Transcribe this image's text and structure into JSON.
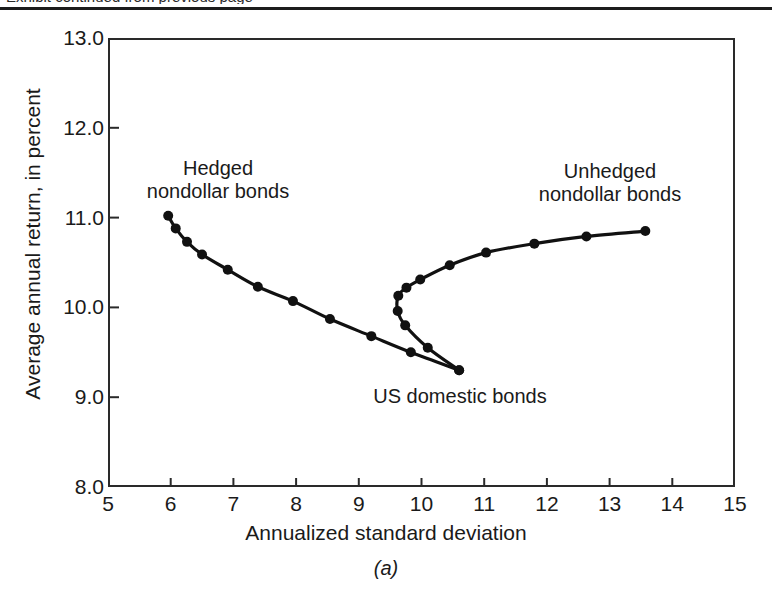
{
  "figure": {
    "top_clipped_text": "Exhibit continued from previous page",
    "caption": "(a)"
  },
  "chart_data": {
    "type": "line",
    "title": "",
    "xlabel": "Annualized standard deviation",
    "ylabel": "Average annual return, in percent",
    "xlim": [
      5,
      15
    ],
    "ylim": [
      8.0,
      13.0
    ],
    "xticks": [
      "5",
      "6",
      "7",
      "8",
      "9",
      "10",
      "11",
      "12",
      "13",
      "14",
      "15"
    ],
    "yticks": [
      "13.0",
      "12.0",
      "11.0",
      "10.0",
      "9.0",
      "8.0"
    ],
    "grid": false,
    "legend_position": "inline-annotations",
    "marker": "filled-circle",
    "line_color": "#111111",
    "annotations": [
      {
        "id": "hedged",
        "text": "Hedged\nnondollar bonds"
      },
      {
        "id": "unhedged",
        "text": "Unhedged\nnondollar bonds"
      },
      {
        "id": "domestic",
        "text": "US domestic bonds"
      }
    ],
    "series": [
      {
        "name": "Hedged nondollar bonds",
        "points": [
          [
            5.96,
            11.02
          ],
          [
            6.08,
            10.88
          ],
          [
            6.26,
            10.73
          ],
          [
            6.5,
            10.59
          ],
          [
            6.91,
            10.42
          ],
          [
            7.39,
            10.23
          ],
          [
            7.95,
            10.07
          ],
          [
            8.54,
            9.87
          ],
          [
            9.2,
            9.68
          ],
          [
            9.83,
            9.5
          ],
          [
            10.6,
            9.3
          ]
        ]
      },
      {
        "name": "Unhedged nondollar bonds",
        "points": [
          [
            10.6,
            9.3
          ],
          [
            10.1,
            9.55
          ],
          [
            9.74,
            9.8
          ],
          [
            9.62,
            9.96
          ],
          [
            9.63,
            10.13
          ],
          [
            9.76,
            10.22
          ],
          [
            9.98,
            10.31
          ],
          [
            10.45,
            10.47
          ],
          [
            11.03,
            10.61
          ],
          [
            11.8,
            10.71
          ],
          [
            12.63,
            10.79
          ],
          [
            13.57,
            10.85
          ]
        ]
      }
    ],
    "special_points": [
      {
        "name": "US domestic bonds",
        "x": 10.6,
        "y": 9.3
      }
    ]
  }
}
